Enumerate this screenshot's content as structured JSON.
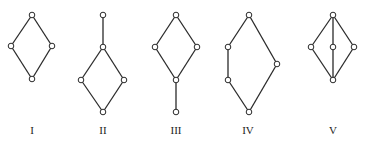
{
  "figure": {
    "diagrams": [
      {
        "label": "I",
        "nodes": [
          [
            32,
            15
          ],
          [
            11,
            46
          ],
          [
            52,
            46
          ],
          [
            32,
            79
          ]
        ],
        "edges": [
          [
            0,
            1
          ],
          [
            0,
            2
          ],
          [
            1,
            3
          ],
          [
            2,
            3
          ]
        ],
        "label_pos": [
          32,
          131
        ]
      },
      {
        "label": "II",
        "nodes": [
          [
            103,
            15
          ],
          [
            103,
            47
          ],
          [
            81,
            80
          ],
          [
            124,
            80
          ],
          [
            103,
            112
          ]
        ],
        "edges": [
          [
            0,
            1
          ],
          [
            1,
            2
          ],
          [
            1,
            3
          ],
          [
            2,
            4
          ],
          [
            3,
            4
          ]
        ],
        "label_pos": [
          103,
          131
        ]
      },
      {
        "label": "III",
        "nodes": [
          [
            176,
            15
          ],
          [
            155,
            47
          ],
          [
            197,
            47
          ],
          [
            176,
            80
          ],
          [
            176,
            112
          ]
        ],
        "edges": [
          [
            0,
            1
          ],
          [
            0,
            2
          ],
          [
            1,
            3
          ],
          [
            2,
            3
          ],
          [
            3,
            4
          ]
        ],
        "label_pos": [
          176,
          131
        ]
      },
      {
        "label": "IV",
        "nodes": [
          [
            249,
            15
          ],
          [
            228,
            47
          ],
          [
            228,
            80
          ],
          [
            277,
            64
          ],
          [
            249,
            112
          ]
        ],
        "edges": [
          [
            0,
            1
          ],
          [
            1,
            2
          ],
          [
            2,
            4
          ],
          [
            0,
            3
          ],
          [
            3,
            4
          ]
        ],
        "label_pos": [
          248,
          131
        ]
      },
      {
        "label": "V",
        "nodes": [
          [
            333,
            15
          ],
          [
            311,
            47
          ],
          [
            333,
            47
          ],
          [
            354,
            47
          ],
          [
            333,
            80
          ]
        ],
        "edges": [
          [
            0,
            1
          ],
          [
            0,
            2
          ],
          [
            0,
            3
          ],
          [
            1,
            4
          ],
          [
            2,
            4
          ],
          [
            3,
            4
          ]
        ],
        "label_pos": [
          333,
          131
        ]
      }
    ]
  },
  "labels": {
    "d0": "I",
    "d1": "II",
    "d2": "III",
    "d3": "IV",
    "d4": "V"
  },
  "colors": {
    "line": "#2a2a2a",
    "node_fill": "#ffffff",
    "background": "#ffffff"
  }
}
